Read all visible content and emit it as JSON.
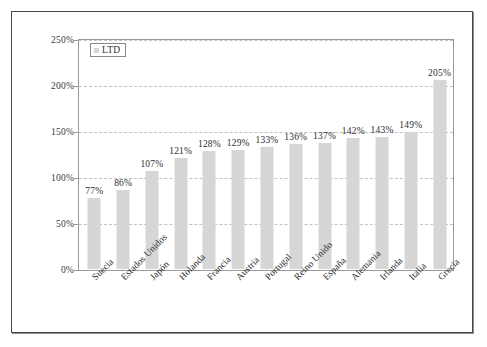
{
  "chart_data": {
    "type": "bar",
    "title": "",
    "subtitle": "",
    "xlabel": "",
    "ylabel": "",
    "ylim": [
      0,
      250
    ],
    "ytick_values": [
      0,
      50,
      100,
      150,
      200,
      250
    ],
    "ytick_labels": [
      "0%",
      "50%",
      "100%",
      "150%",
      "200%",
      "250%"
    ],
    "grid": "horizontal-dashed",
    "legend_position": "top-left-inside",
    "legend": [
      {
        "name": "LTD",
        "color": "#d6d6d6",
        "marker": "square-swatch"
      }
    ],
    "categories": [
      "Suecia",
      "Estados Unidos",
      "Japón",
      "Holanda",
      "Francia",
      "Austria",
      "Portugal",
      "Reino Unido",
      "España",
      "Alemania",
      "Irlanda",
      "Italia",
      "Grecia"
    ],
    "series": [
      {
        "name": "LTD",
        "values": [
          77,
          86,
          107,
          121,
          128,
          129,
          133,
          136,
          137,
          142,
          143,
          149,
          205
        ],
        "data_labels": [
          "77%",
          "86%",
          "107%",
          "121%",
          "128%",
          "129%",
          "133%",
          "136%",
          "137%",
          "142%",
          "143%",
          "149%",
          "205%"
        ],
        "color": "#d6d6d6"
      }
    ],
    "colors": {
      "bar_fill": "#d6d6d6",
      "gridline": "#c2c2c2",
      "axis_line": "#9a9a9a",
      "frame": "#4a4a4a",
      "text": "#2b2b2b",
      "background": "#ffffff"
    }
  }
}
